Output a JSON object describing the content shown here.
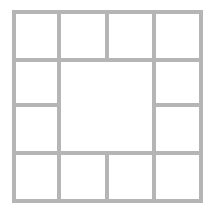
{
  "diagram": {
    "type": "grid-layout",
    "rows": 4,
    "cols": 4,
    "line_color": "#b5b5b5",
    "background": "#ffffff",
    "line_width": 4,
    "col_lines": [
      14,
      59,
      107,
      154,
      201
    ],
    "row_lines": [
      12,
      60,
      105,
      153,
      201
    ],
    "cells": [
      {
        "id": "r1c1",
        "row": 1,
        "col": 1,
        "rowspan": 1,
        "colspan": 1
      },
      {
        "id": "r1c2",
        "row": 1,
        "col": 2,
        "rowspan": 1,
        "colspan": 1
      },
      {
        "id": "r1c3",
        "row": 1,
        "col": 3,
        "rowspan": 1,
        "colspan": 1
      },
      {
        "id": "r1c4",
        "row": 1,
        "col": 4,
        "rowspan": 1,
        "colspan": 1
      },
      {
        "id": "r2c1",
        "row": 2,
        "col": 1,
        "rowspan": 1,
        "colspan": 1
      },
      {
        "id": "center",
        "row": 2,
        "col": 2,
        "rowspan": 2,
        "colspan": 2
      },
      {
        "id": "r2c4",
        "row": 2,
        "col": 4,
        "rowspan": 1,
        "colspan": 1
      },
      {
        "id": "r3c1",
        "row": 3,
        "col": 1,
        "rowspan": 1,
        "colspan": 1
      },
      {
        "id": "r3c4",
        "row": 3,
        "col": 4,
        "rowspan": 1,
        "colspan": 1
      },
      {
        "id": "r4c1",
        "row": 4,
        "col": 1,
        "rowspan": 1,
        "colspan": 1
      },
      {
        "id": "r4c2",
        "row": 4,
        "col": 2,
        "rowspan": 1,
        "colspan": 1
      },
      {
        "id": "r4c3",
        "row": 4,
        "col": 3,
        "rowspan": 1,
        "colspan": 1
      },
      {
        "id": "r4c4",
        "row": 4,
        "col": 4,
        "rowspan": 1,
        "colspan": 1
      }
    ]
  }
}
